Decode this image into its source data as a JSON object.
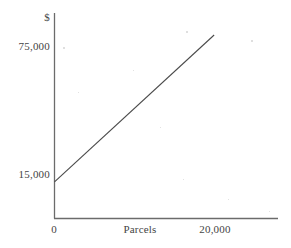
{
  "chart_data": {
    "type": "line",
    "title": "",
    "subtitle": "",
    "xlabel": "Parcels",
    "ylabel": "$",
    "x": [
      0,
      20000
    ],
    "values": [
      15000,
      75000
    ],
    "series": [
      {
        "name": "Cost",
        "x": [
          0,
          20000
        ],
        "values": [
          15000,
          75000
        ]
      }
    ],
    "xtick_labels": [
      "0",
      "20,000"
    ],
    "xtick_values": [
      0,
      20000
    ],
    "ytick_labels": [
      "15,000",
      "75,000"
    ],
    "ytick_values": [
      15000,
      75000
    ],
    "xlim": [
      0,
      28000
    ],
    "ylim": [
      0,
      84000
    ],
    "grid": false,
    "legend": null,
    "annotations": [],
    "line_color": "#4a4a4a",
    "axis_color": "#6b6b6b",
    "background_color": "#ffffff"
  },
  "axes": {
    "y_unit_label": "$",
    "y_tick_top": "75,000",
    "y_tick_bottom": "15,000",
    "x_tick_origin": "0",
    "x_tick_max": "20,000",
    "x_axis_title": "Parcels"
  }
}
